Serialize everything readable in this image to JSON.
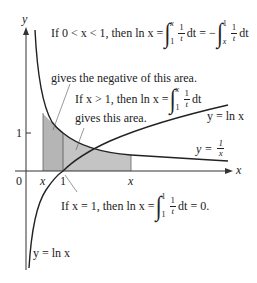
{
  "diagram": {
    "axes": {
      "x_label": "x",
      "y_label": "y",
      "origin_label": "0",
      "x_tick_one": "1",
      "y_tick_one": "1",
      "x_marker_left": "x",
      "x_marker_right": "x"
    },
    "curves": [
      {
        "name": "reciprocal",
        "label_prefix": "y = ",
        "numerator": "1",
        "denominator": "x"
      },
      {
        "name": "natural-log-upper",
        "label": "y = ln x"
      },
      {
        "name": "natural-log-lower",
        "label": "y = ln x"
      }
    ],
    "annotations": {
      "case_less_than_one": {
        "prefix": "If 0 < x < 1, then ln x =",
        "int1_upper": "x",
        "int1_lower": "1",
        "frac_num": "1",
        "frac_den": "t",
        "dt1": "dt = −",
        "int2_upper": "1",
        "int2_lower": "x",
        "dt2": "dt",
        "line2": "gives the negative of this area."
      },
      "case_greater_than_one": {
        "prefix": "If x > 1, then ln x =",
        "int_upper": "x",
        "int_lower": "1",
        "frac_num": "1",
        "frac_den": "t",
        "dt": "dt",
        "line2": "gives this area."
      },
      "case_equal_one": {
        "prefix": "If x = 1, then ln x =",
        "int_upper": "1",
        "int_lower": "1",
        "frac_num": "1",
        "frac_den": "t",
        "suffix": "dt = 0."
      }
    },
    "colors": {
      "curve": "#222222",
      "axis": "#333333",
      "shade": "#b8b8b8",
      "leader": "#555555"
    }
  }
}
